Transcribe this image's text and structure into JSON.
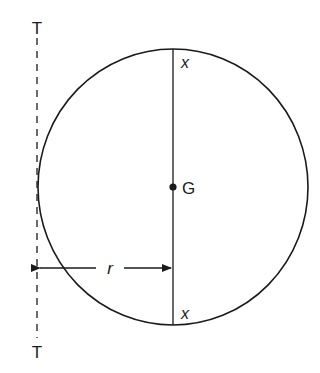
{
  "diagram": {
    "type": "circle-with-tangent-axis",
    "axis": {
      "label_top": "T",
      "label_bottom": "T",
      "style": "dashed"
    },
    "circle": {
      "center_label": "G",
      "diameter_end_label_top": "x",
      "diameter_end_label_bottom": "x"
    },
    "dimension": {
      "label": "r",
      "description": "distance from axis T-T to diameter x-x through G"
    },
    "colors": {
      "stroke": "#1a1a1a",
      "background": "#ffffff"
    }
  }
}
